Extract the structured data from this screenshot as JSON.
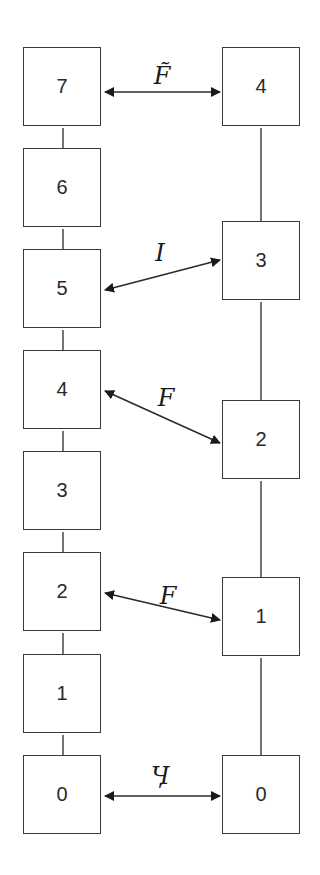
{
  "diagram": {
    "left_column": {
      "boxes": [
        "7",
        "6",
        "5",
        "4",
        "3",
        "2",
        "1",
        "0"
      ]
    },
    "right_column": {
      "boxes": [
        "4",
        "3",
        "2",
        "1",
        "0"
      ]
    },
    "links": [
      {
        "from": "left 7",
        "to": "right 4",
        "label": "F̃"
      },
      {
        "from": "left 5",
        "to": "right 3",
        "label": "I"
      },
      {
        "from": "left 4",
        "to": "right 2",
        "label": "F"
      },
      {
        "from": "left 2",
        "to": "right 1",
        "label": "F"
      },
      {
        "from": "left 0",
        "to": "right 0",
        "label": "Ӌ"
      }
    ],
    "colors": {
      "line": "#2a2a2a",
      "box_border": "#3a3a3a",
      "background": "#ffffff"
    }
  }
}
